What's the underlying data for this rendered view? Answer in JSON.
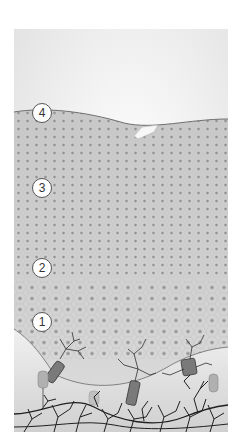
{
  "figure": {
    "type": "skin-epidermis-layer-illustration",
    "colors": {
      "background": "#ffffff",
      "sky": "#f1f1f1",
      "tissue": "#cfcfcf",
      "tissue_light": "#dcdcdc",
      "nucleus": "#8c8c8c",
      "cell_border": "#bdbdbd",
      "basement_line": "#666666",
      "dermis": "#e6e6e6",
      "nerve": "#2a2a2a",
      "cell_body": "#7a7a7a"
    },
    "callouts": [
      {
        "id": "4",
        "label": "4",
        "x": 18,
        "y": 74
      },
      {
        "id": "3",
        "label": "3",
        "x": 18,
        "y": 149
      },
      {
        "id": "2",
        "label": "2",
        "x": 18,
        "y": 229
      },
      {
        "id": "1",
        "label": "1",
        "x": 18,
        "y": 313
      }
    ]
  }
}
